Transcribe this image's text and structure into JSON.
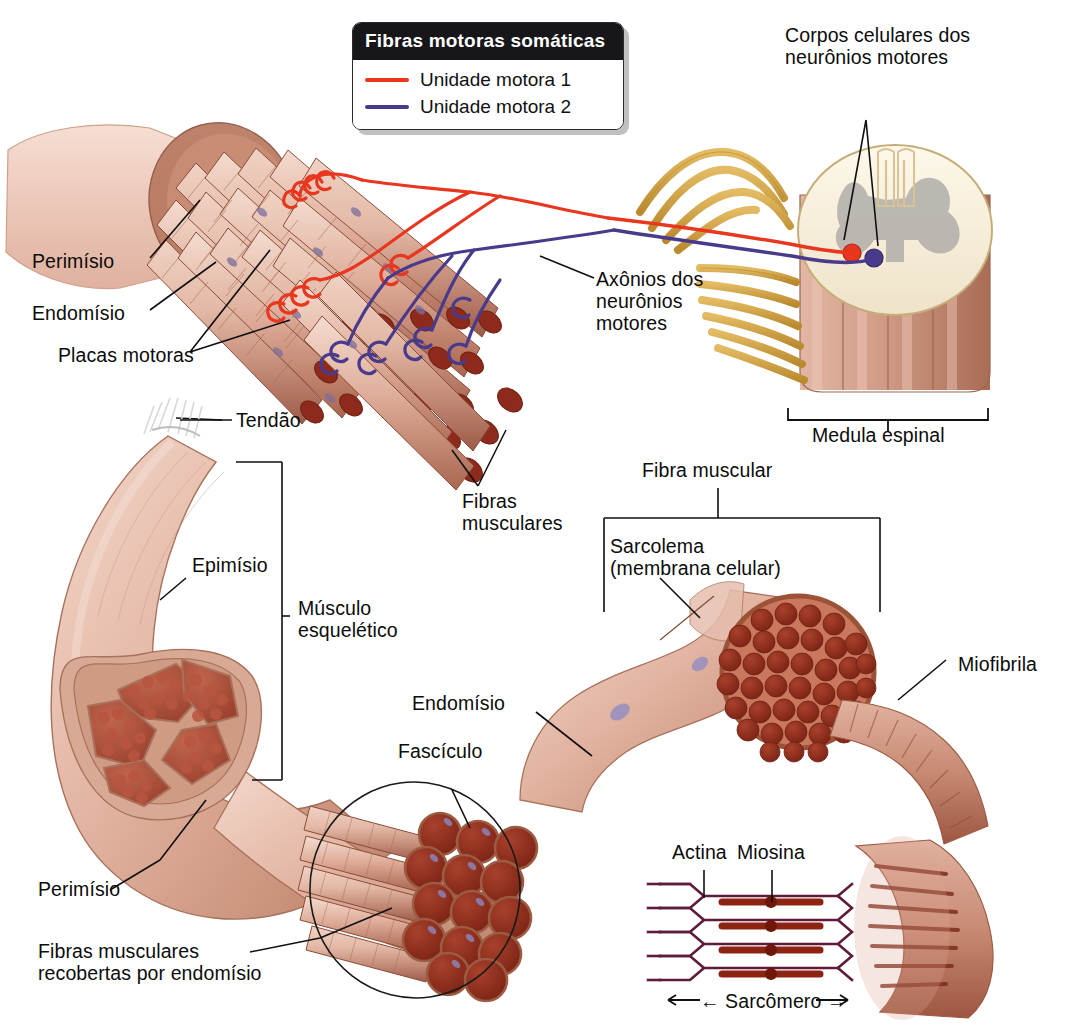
{
  "figure": {
    "language": "pt-BR"
  },
  "legend": {
    "header": "Fibras motoras somáticas",
    "items": [
      {
        "label": "Unidade motora 1",
        "color": "#e8361f"
      },
      {
        "label": "Unidade motora 2",
        "color": "#4a3a8c"
      }
    ]
  },
  "labels": {
    "perimisio_top": "Perimísio",
    "endomisio_top": "Endomísio",
    "placas_motoras": "Placas motoras",
    "corpos_celulares": "Corpos celulares dos\nneurônios motores",
    "axonios": "Axônios dos\nneurônios\nmotores",
    "medula_espinal": "Medula espinal",
    "tendao": "Tendão",
    "fibras_musculares": "Fibras\nmusculares",
    "epimisio": "Epimísio",
    "musculo_esqueletico": "Músculo\nesquelético",
    "fibra_muscular": "Fibra muscular",
    "sarcolema": "Sarcolema\n(membrana celular)",
    "endomisio_mid": "Endomísio",
    "fasciculo": "Fascículo",
    "miofibrila": "Miofibrila",
    "perimisio_bottom": "Perimísio",
    "fibras_recobertas": "Fibras musculares\nrecobertas por endomísio",
    "actina": "Actina",
    "miosina": "Miosina",
    "sarcomero": "← Sarcômero →"
  },
  "colors": {
    "motor_unit_1": "#e8361f",
    "motor_unit_2": "#4a3a8c",
    "nerve_gold": "#d6a33f",
    "muscle_pink": "#dba694",
    "muscle_deep_red": "#a2402e",
    "myofibril_red": "#8e2b1d",
    "perimysium_tan": "#c08a71",
    "cord_cream": "#f6efdc",
    "gray_matter": "#b5b2ad",
    "leader_line": "#101010",
    "skin_light": "#e9c4b3"
  }
}
